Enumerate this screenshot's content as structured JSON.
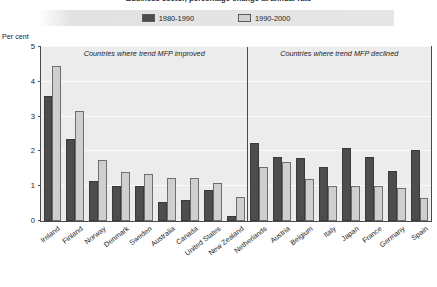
{
  "title": "Business sector, percentage change at annual rate",
  "axis": {
    "ylabel": "Per cent",
    "yticks": [
      "0",
      "1",
      "2",
      "3",
      "4",
      "5"
    ]
  },
  "legend": {
    "items": [
      {
        "label": "1980-1990",
        "color": "#4d4d4d",
        "swatch": "dark"
      },
      {
        "label": "1990-2000",
        "color": "#cfcfcf",
        "swatch": "light"
      }
    ]
  },
  "panels": [
    {
      "label": "Countries where trend MFP improved"
    },
    {
      "label": "Countries where trend MFP declined"
    }
  ],
  "chart_data": {
    "type": "bar",
    "title": "Business sector, percentage change at annual rate",
    "xlabel": "",
    "ylabel": "Per cent",
    "ylim": [
      0,
      5
    ],
    "yticks": [
      0,
      1,
      2,
      3,
      4,
      5
    ],
    "grid": true,
    "legend_position": "top",
    "categories": [
      "Ireland",
      "Finland",
      "Norway",
      "Denmark",
      "Sweden",
      "Australia",
      "Canada",
      "United States",
      "New Zealand",
      "Netherlands",
      "Austria",
      "Belgium",
      "Italy",
      "Japan",
      "France",
      "Germany",
      "Spain"
    ],
    "series": [
      {
        "name": "1980-1990",
        "color": "#4d4d4d",
        "values": [
          3.6,
          2.35,
          1.15,
          1.0,
          1.0,
          0.55,
          0.6,
          0.9,
          0.15,
          2.25,
          1.85,
          1.8,
          1.55,
          2.1,
          1.85,
          1.45,
          2.05
        ]
      },
      {
        "name": "1990-2000",
        "color": "#cfcfcf",
        "values": [
          4.45,
          3.15,
          1.75,
          1.4,
          1.35,
          1.25,
          1.25,
          1.1,
          0.7,
          1.55,
          1.7,
          1.2,
          1.0,
          1.0,
          1.0,
          0.95,
          0.65
        ]
      }
    ],
    "groups": [
      {
        "label": "Countries where trend MFP improved",
        "categories": 9
      },
      {
        "label": "Countries where trend MFP declined",
        "categories": 8
      }
    ],
    "annotations": [
      "Countries where trend MFP improved",
      "Countries where trend MFP declined"
    ]
  }
}
